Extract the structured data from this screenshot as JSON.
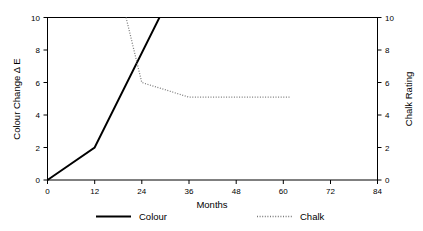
{
  "chart_data": {
    "type": "line",
    "title": "",
    "subtitle": "",
    "xlabel": "Months",
    "ylabel": "Colour Change Δ E",
    "y2label": "Chalk Rating",
    "xlim": [
      0,
      84
    ],
    "ylim": [
      0,
      10
    ],
    "y2lim": [
      0,
      10
    ],
    "xticks": [
      0,
      12,
      24,
      36,
      48,
      60,
      72,
      84
    ],
    "xticklabels": [
      "0",
      "12",
      "24",
      "36",
      "48",
      "60",
      "72",
      "84"
    ],
    "yticks": [
      0,
      2,
      4,
      6,
      8,
      10
    ],
    "yticklabels": [
      "0",
      "2",
      "4",
      "6",
      "8",
      "10"
    ],
    "y2ticks": [
      0,
      2,
      4,
      6,
      8,
      10
    ],
    "y2ticklabels": [
      "0",
      "2",
      "4",
      "6",
      "8",
      "10"
    ],
    "grid": false,
    "legend_position": "below-center",
    "series": [
      {
        "name": "Colour",
        "axis": "left",
        "style": "solid",
        "color": "#000000",
        "x": [
          0,
          12,
          28.5
        ],
        "values": [
          0,
          2,
          10
        ]
      },
      {
        "name": "Chalk",
        "axis": "right",
        "style": "dotted",
        "color": "#7a7a7a",
        "x": [
          20,
          24,
          28,
          32,
          36,
          48,
          62
        ],
        "values": [
          10,
          6,
          5.7,
          5.4,
          5.1,
          5.1,
          5.1
        ]
      }
    ],
    "annotations": []
  },
  "legend": {
    "items": [
      {
        "label": "Colour",
        "style": "solid",
        "color": "#000000"
      },
      {
        "label": "Chalk",
        "style": "dotted",
        "color": "#7a7a7a"
      }
    ]
  },
  "colors": {
    "background": "#ffffff",
    "axis": "#000000",
    "colour_series": "#000000",
    "chalk_series": "#7a7a7a"
  }
}
